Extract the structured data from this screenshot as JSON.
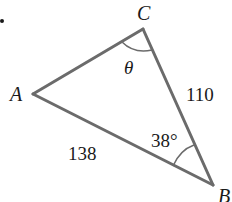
{
  "diagram": {
    "type": "triangle",
    "bullet": "•",
    "vertices": {
      "A": {
        "label": "A",
        "x": 33,
        "y": 94
      },
      "B": {
        "label": "B",
        "x": 213,
        "y": 185
      },
      "C": {
        "label": "C",
        "x": 143,
        "y": 29
      }
    },
    "sides": {
      "AB": {
        "label": "138"
      },
      "BC": {
        "label": "110"
      },
      "AC": {
        "label": ""
      }
    },
    "angles": {
      "C": {
        "label": "θ"
      },
      "B": {
        "label": "38°"
      }
    },
    "colors": {
      "stroke": "#6b6b6b",
      "text": "#1a1a1a",
      "background": "#ffffff"
    }
  }
}
